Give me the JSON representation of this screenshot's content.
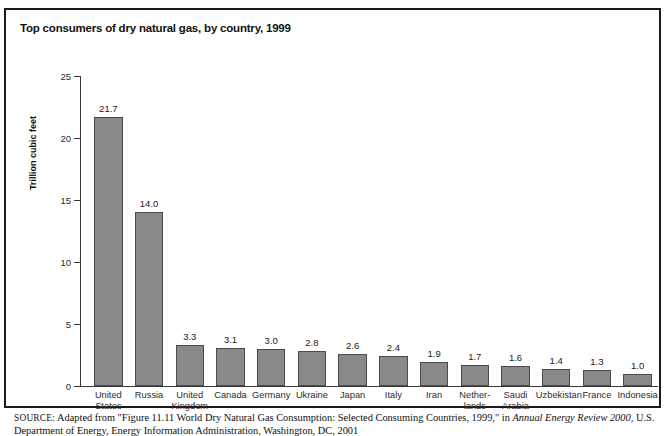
{
  "figure": {
    "title": "Top consumers of dry natural gas, by country, 1999",
    "source_label": "SOURCE:",
    "source_text_part1": " Adapted from \"Figure 11.11 World Dry Natural Gas Consumption: Selected Consuming Countries, 1999,\" in ",
    "source_italic": "Annual Energy Review 2000",
    "source_text_part2": ", U.S. Department of Energy, Energy Information Administration, Washington, DC, 2001"
  },
  "chart_data": {
    "type": "bar",
    "title": "Top consumers of dry natural gas, by country, 1999",
    "xlabel": "",
    "ylabel": "Trillion cubic feet",
    "ylim": [
      0,
      25
    ],
    "yticks": [
      0,
      5,
      10,
      15,
      20,
      25
    ],
    "ytick_labels": [
      "0",
      "5",
      "10",
      "15",
      "20",
      "25"
    ],
    "grid": false,
    "legend": "none",
    "value_labels": true,
    "bar_color": "#898989",
    "bar_edge_color": "#4a4a4a",
    "categories": [
      "United\nStates",
      "Russia",
      "United\nKingdom",
      "Canada",
      "Germany",
      "Ukraine",
      "Japan",
      "Italy",
      "Iran",
      "Nether-\nlands",
      "Saudi\nArabia",
      "Uzbekistan",
      "France",
      "Indonesia"
    ],
    "values": [
      21.7,
      14.0,
      3.3,
      3.1,
      3.0,
      2.8,
      2.6,
      2.4,
      1.9,
      1.7,
      1.6,
      1.4,
      1.3,
      1.0
    ],
    "value_label_text": [
      "21.7",
      "14.0",
      "3.3",
      "3.1",
      "3.0",
      "2.8",
      "2.6",
      "2.4",
      "1.9",
      "1.7",
      "1.6",
      "1.4",
      "1.3",
      "1.0"
    ]
  }
}
